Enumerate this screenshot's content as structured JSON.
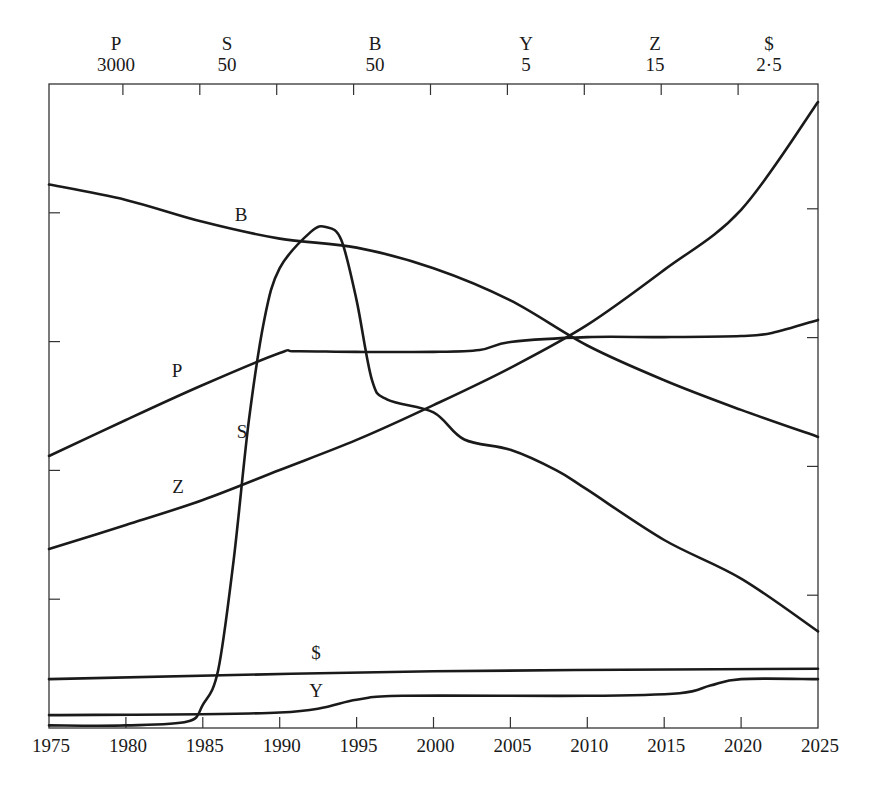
{
  "chart_data": {
    "type": "line",
    "title": "",
    "xlabel": "",
    "ylabel": "",
    "x_range": [
      1975,
      2025
    ],
    "x_ticks": [
      1975,
      1980,
      1985,
      1990,
      1995,
      2000,
      2005,
      2010,
      2015,
      2020,
      2025
    ],
    "y_divisions": 5,
    "grid": false,
    "legend": "inline labels on curves",
    "scale_header": [
      {
        "series": "P",
        "max": "3000"
      },
      {
        "series": "S",
        "max": "50"
      },
      {
        "series": "B",
        "max": "50"
      },
      {
        "series": "Y",
        "max": "5"
      },
      {
        "series": "Z",
        "max": "15"
      },
      {
        "series": "$",
        "max": "2·5"
      }
    ],
    "series": [
      {
        "name": "B",
        "max": 50,
        "x": [
          1975,
          1980,
          1985,
          1990,
          1995,
          2000,
          2005,
          2010,
          2015,
          2020,
          2025
        ],
        "values": [
          42.2,
          41.0,
          39.3,
          38.0,
          37.3,
          35.7,
          33.2,
          29.7,
          27.0,
          24.7,
          22.6
        ],
        "label_pos": [
          241,
          221
        ]
      },
      {
        "name": "P",
        "max": 3000,
        "x": [
          1975,
          1980,
          1985,
          1990,
          1991,
          1995,
          2000,
          2003,
          2005,
          2010,
          2015,
          2020,
          2022,
          2025
        ],
        "values": [
          1267,
          1435,
          1598,
          1747,
          1755,
          1752,
          1752,
          1761,
          1798,
          1821,
          1821,
          1826,
          1840,
          1901
        ],
        "label_pos": [
          177,
          377
        ]
      },
      {
        "name": "S",
        "max": 50,
        "x": [
          1975,
          1980,
          1984,
          1985,
          1986,
          1987,
          1988,
          1989,
          1990,
          1992,
          1993,
          1994,
          1995,
          1996,
          1997,
          2000,
          2002,
          2005,
          2008,
          2010,
          2015,
          2020,
          2025
        ],
        "values": [
          0.2,
          0.2,
          0.5,
          1.8,
          4.5,
          13.0,
          23.9,
          31.7,
          35.7,
          38.5,
          38.9,
          37.9,
          33.2,
          27.0,
          25.5,
          24.5,
          22.4,
          21.6,
          20.0,
          18.5,
          14.6,
          11.6,
          7.5
        ],
        "label_pos": [
          242,
          438
        ]
      },
      {
        "name": "Z",
        "max": 15,
        "x": [
          1975,
          1980,
          1985,
          1990,
          1995,
          2000,
          2005,
          2010,
          2015,
          2020,
          2025
        ],
        "values": [
          4.17,
          4.73,
          5.31,
          6.01,
          6.71,
          7.52,
          8.39,
          9.39,
          10.67,
          12.07,
          14.58
        ],
        "label_pos": [
          178,
          493
        ]
      },
      {
        "name": "$",
        "max": 2.5,
        "x": [
          1975,
          2000,
          2025
        ],
        "values": [
          0.19,
          0.22,
          0.23
        ],
        "label_pos": [
          316,
          659
        ]
      },
      {
        "name": "Y",
        "max": 5,
        "x": [
          1975,
          1990,
          1995,
          1998,
          2010,
          2016,
          2018,
          2020,
          2025
        ],
        "values": [
          0.1,
          0.12,
          0.22,
          0.25,
          0.25,
          0.27,
          0.33,
          0.38,
          0.38
        ],
        "label_pos": [
          316,
          697
        ]
      }
    ]
  },
  "style": {
    "line_color": "#1a1a1a",
    "frame_color": "#333333",
    "background": "#ffffff"
  }
}
